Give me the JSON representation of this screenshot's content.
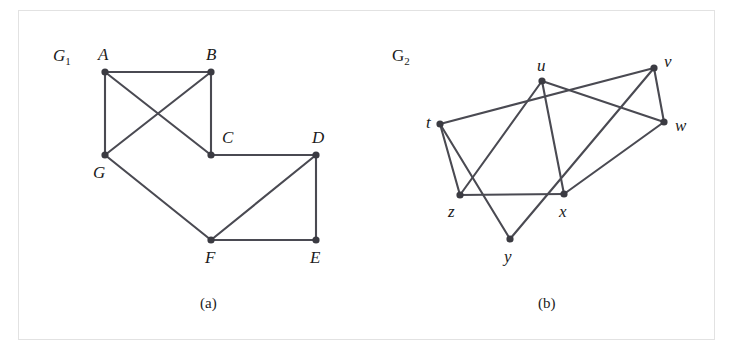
{
  "figure": {
    "border_color": "#b9b9b9",
    "background": "#ffffff",
    "edge_color": "#4a4a52",
    "vertex_color": "#3b3b42",
    "captions": [
      {
        "text": "(a)",
        "x": 200,
        "y": 296
      },
      {
        "text": "(b)",
        "x": 538,
        "y": 296
      }
    ],
    "graph_labels": [
      {
        "base": "G",
        "sub": "1",
        "x": 53,
        "y": 47,
        "italic": true
      },
      {
        "base": "G",
        "sub": "2",
        "x": 392,
        "y": 47,
        "italic": false
      }
    ]
  },
  "graph_data": {
    "type": "graph",
    "graphs": [
      {
        "name": "G1",
        "caption": "(a)",
        "vertex_count": 7,
        "edge_count": 9,
        "vertices": [
          {
            "id": "A",
            "label": "A",
            "x": 105,
            "y": 72,
            "label_x": 98,
            "label_y": 46
          },
          {
            "id": "B",
            "label": "B",
            "x": 211,
            "y": 72,
            "label_x": 206,
            "label_y": 46
          },
          {
            "id": "C",
            "label": "C",
            "x": 211,
            "y": 155,
            "label_x": 222,
            "label_y": 129
          },
          {
            "id": "D",
            "label": "D",
            "x": 316,
            "y": 155,
            "label_x": 312,
            "label_y": 129
          },
          {
            "id": "E",
            "label": "E",
            "x": 316,
            "y": 240,
            "label_x": 310,
            "label_y": 249
          },
          {
            "id": "F",
            "label": "F",
            "x": 211,
            "y": 240,
            "label_x": 205,
            "label_y": 249
          },
          {
            "id": "G",
            "label": "G",
            "x": 105,
            "y": 155,
            "label_x": 93,
            "label_y": 164
          }
        ],
        "edges": [
          [
            "A",
            "B"
          ],
          [
            "A",
            "G"
          ],
          [
            "A",
            "C"
          ],
          [
            "B",
            "G"
          ],
          [
            "B",
            "C"
          ],
          [
            "C",
            "D"
          ],
          [
            "D",
            "E"
          ],
          [
            "D",
            "F"
          ],
          [
            "E",
            "F"
          ],
          [
            "F",
            "G"
          ]
        ]
      },
      {
        "name": "G2",
        "caption": "(b)",
        "vertex_count": 7,
        "edge_count": 10,
        "vertices": [
          {
            "id": "t",
            "label": "t",
            "x": 440,
            "y": 124,
            "label_x": 426,
            "label_y": 114
          },
          {
            "id": "u",
            "label": "u",
            "x": 542,
            "y": 81,
            "label_x": 537,
            "label_y": 57
          },
          {
            "id": "v",
            "label": "v",
            "x": 654,
            "y": 68,
            "label_x": 664,
            "label_y": 53
          },
          {
            "id": "w",
            "label": "w",
            "x": 664,
            "y": 122,
            "label_x": 675,
            "label_y": 117
          },
          {
            "id": "x",
            "label": "x",
            "x": 564,
            "y": 194,
            "label_x": 559,
            "label_y": 203
          },
          {
            "id": "y",
            "label": "y",
            "x": 510,
            "y": 239,
            "label_x": 504,
            "label_y": 248
          },
          {
            "id": "z",
            "label": "z",
            "x": 460,
            "y": 195,
            "label_x": 448,
            "label_y": 203
          }
        ],
        "edges": [
          [
            "t",
            "v"
          ],
          [
            "t",
            "z"
          ],
          [
            "t",
            "y"
          ],
          [
            "u",
            "z"
          ],
          [
            "u",
            "x"
          ],
          [
            "u",
            "w"
          ],
          [
            "v",
            "w"
          ],
          [
            "v",
            "y"
          ],
          [
            "w",
            "x"
          ],
          [
            "x",
            "z"
          ]
        ]
      }
    ]
  }
}
